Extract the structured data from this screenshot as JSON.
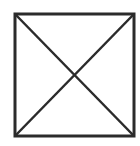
{
  "figure": {
    "shape": "square-with-diagonals",
    "stroke_color": "#2b2b2b",
    "background": "#ffffff",
    "box": {
      "x": 15,
      "y": 14,
      "width": 119,
      "height": 122,
      "stroke_width": 3
    },
    "diagonals": [
      {
        "x1": 15,
        "y1": 14,
        "x2": 134,
        "y2": 136
      },
      {
        "x1": 134,
        "y1": 14,
        "x2": 15,
        "y2": 136
      }
    ]
  }
}
